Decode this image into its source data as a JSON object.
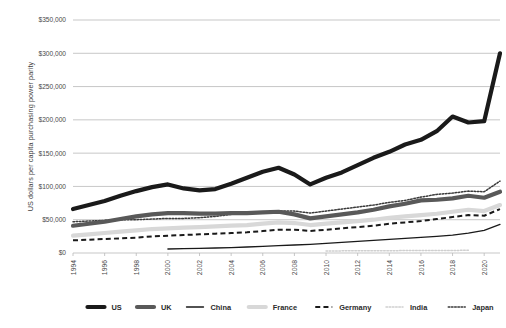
{
  "chart_data": {
    "type": "line",
    "title": "",
    "xlabel": "",
    "ylabel": "US dollars per capita purchasing power parity",
    "ylim": [
      0,
      350000
    ],
    "xlim": [
      1994,
      2021
    ],
    "grid": true,
    "legend_position": "bottom",
    "y_ticks": [
      "$0",
      "$50,000",
      "$100,000",
      "$150,000",
      "$200,000",
      "$250,000",
      "$300,000",
      "$350,000"
    ],
    "y_tick_values": [
      0,
      50000,
      100000,
      150000,
      200000,
      250000,
      300000,
      350000
    ],
    "x_ticks": [
      "1994",
      "1996",
      "1998",
      "2000",
      "2002",
      "2004",
      "2006",
      "2008",
      "2010",
      "2012",
      "2014",
      "2016",
      "2018",
      "2020"
    ],
    "x": [
      1994,
      1995,
      1996,
      1997,
      1998,
      1999,
      2000,
      2001,
      2002,
      2003,
      2004,
      2005,
      2006,
      2007,
      2008,
      2009,
      2010,
      2011,
      2012,
      2013,
      2014,
      2015,
      2016,
      2017,
      2018,
      2019,
      2020,
      2021
    ],
    "series": [
      {
        "name": "US",
        "color": "#1a1a1a",
        "style": "solid-thick",
        "values": [
          66000,
          72000,
          78000,
          86000,
          93000,
          99000,
          103000,
          97000,
          94000,
          96000,
          104000,
          113000,
          122000,
          128000,
          118000,
          103000,
          113000,
          121000,
          132000,
          143000,
          152000,
          163000,
          170000,
          183000,
          205000,
          196000,
          198000,
          300000
        ]
      },
      {
        "name": "UK",
        "color": "#595959",
        "style": "solid-thick",
        "values": [
          41000,
          44000,
          47000,
          51000,
          55000,
          58000,
          60000,
          60000,
          59000,
          59000,
          60000,
          60000,
          61000,
          62000,
          58000,
          52000,
          55000,
          58000,
          61000,
          65000,
          70000,
          74000,
          79000,
          80000,
          82000,
          86000,
          83000,
          92000
        ]
      },
      {
        "name": "China",
        "color": "#1a1a1a",
        "style": "solid-thin",
        "values": [
          null,
          null,
          null,
          null,
          null,
          null,
          6000,
          6500,
          7000,
          7500,
          8200,
          9000,
          10000,
          11000,
          12000,
          13000,
          14500,
          16000,
          17500,
          19000,
          20500,
          22000,
          23500,
          25000,
          27000,
          30000,
          34000,
          43000
        ]
      },
      {
        "name": "France",
        "color": "#d8d8d8",
        "style": "solid-thick",
        "values": [
          26000,
          28000,
          30000,
          32000,
          34000,
          36000,
          37000,
          38000,
          39000,
          40000,
          41000,
          42000,
          44000,
          46000,
          45000,
          42000,
          44000,
          46000,
          48000,
          50000,
          53000,
          55000,
          57000,
          59000,
          62000,
          65000,
          63000,
          72000
        ]
      },
      {
        "name": "Germany",
        "color": "#1a1a1a",
        "style": "dashed",
        "values": [
          19000,
          20000,
          21000,
          22000,
          23000,
          25000,
          26000,
          27000,
          28000,
          29000,
          30000,
          31000,
          33000,
          35000,
          35000,
          33000,
          35000,
          37000,
          39000,
          41000,
          44000,
          46000,
          48000,
          51000,
          54000,
          57000,
          56000,
          66000
        ]
      },
      {
        "name": "India",
        "color": "#cfcfcf",
        "style": "dotted",
        "values": [
          null,
          null,
          null,
          null,
          null,
          null,
          null,
          null,
          null,
          null,
          null,
          null,
          null,
          null,
          null,
          null,
          3000,
          3200,
          3300,
          3400,
          3500,
          3600,
          3700,
          3800,
          3900,
          4000,
          null,
          null
        ]
      },
      {
        "name": "Japan",
        "color": "#3a3a3a",
        "style": "dotted",
        "values": [
          47000,
          48000,
          49000,
          50000,
          50000,
          51000,
          52000,
          52000,
          53000,
          55000,
          58000,
          60000,
          61000,
          63000,
          63000,
          60000,
          63000,
          66000,
          69000,
          72000,
          76000,
          79000,
          84000,
          88000,
          90000,
          93000,
          92000,
          108000
        ]
      }
    ]
  },
  "legend": {
    "items": [
      {
        "label": "US"
      },
      {
        "label": "UK"
      },
      {
        "label": "China"
      },
      {
        "label": "France"
      },
      {
        "label": "Germany"
      },
      {
        "label": "India"
      },
      {
        "label": "Japan"
      }
    ]
  }
}
